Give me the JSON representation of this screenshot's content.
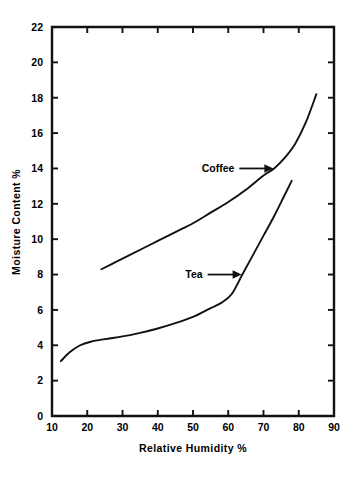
{
  "chart_data": {
    "type": "line",
    "title": "",
    "xlabel": "Relative  Humidity  %",
    "ylabel": "Moisture  Content  %",
    "xlim": [
      10,
      90
    ],
    "ylim": [
      0,
      22
    ],
    "xticks": [
      10,
      20,
      30,
      40,
      50,
      60,
      70,
      80,
      90
    ],
    "xtick_labels": [
      "10",
      "20",
      "30",
      "40",
      "50",
      "60",
      "70",
      "80",
      "90"
    ],
    "yticks": [
      0,
      2,
      4,
      6,
      8,
      10,
      12,
      14,
      16,
      18,
      20,
      22
    ],
    "ytick_labels": [
      "0",
      "2",
      "4",
      "6",
      "8",
      "10",
      "12",
      "14",
      "16",
      "18",
      "20",
      "22"
    ],
    "grid": false,
    "legend": "none",
    "tick_direction": "in",
    "series": [
      {
        "name": "Coffee",
        "label": "Coffee",
        "color": "#111111",
        "x": [
          24,
          28,
          32,
          36,
          40,
          45,
          50,
          55,
          60,
          65,
          70,
          73,
          76,
          79,
          82,
          85
        ],
        "y": [
          8.3,
          8.7,
          9.1,
          9.5,
          9.9,
          10.4,
          10.9,
          11.5,
          12.1,
          12.8,
          13.6,
          14.0,
          14.6,
          15.4,
          16.6,
          18.2
        ]
      },
      {
        "name": "Tea",
        "label": "Tea",
        "color": "#111111",
        "x": [
          12.5,
          15,
          18,
          21,
          25,
          30,
          35,
          40,
          45,
          50,
          55,
          58,
          61,
          64,
          67,
          70,
          73,
          76,
          78
        ],
        "y": [
          3.1,
          3.6,
          4.0,
          4.2,
          4.35,
          4.5,
          4.7,
          4.95,
          5.25,
          5.6,
          6.1,
          6.4,
          6.9,
          8.0,
          9.1,
          10.2,
          11.3,
          12.5,
          13.3
        ]
      }
    ],
    "annotations": [
      {
        "name": "coffee-annotation",
        "text": "Coffee",
        "points_to": {
          "x": 72.8,
          "y": 14.0
        },
        "arrow": "right"
      },
      {
        "name": "tea-annotation",
        "text": "Tea",
        "points_to": {
          "x": 63.8,
          "y": 8.0
        },
        "arrow": "right"
      }
    ]
  }
}
